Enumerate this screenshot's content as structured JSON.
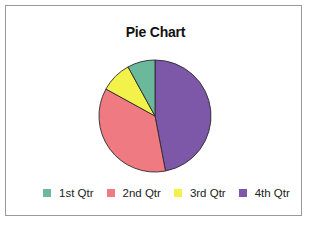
{
  "chart_data": {
    "type": "pie",
    "title": "Pie Chart",
    "categories": [
      "1st Qtr",
      "2nd Qtr",
      "3rd Qtr",
      "4th Qtr"
    ],
    "values": [
      8,
      36,
      9,
      47
    ],
    "unit": "percent (estimated from slice angles)",
    "colors": [
      "#6bb89a",
      "#f07a82",
      "#f2f24a",
      "#7e58a8"
    ],
    "start_angle_deg": 0,
    "direction": "4th Qtr drawn clockwise from 12 o'clock; 1st Qtr counter-clockwise from 12 o'clock",
    "legend_position": "bottom"
  },
  "legend": {
    "items": [
      {
        "label": "1st Qtr",
        "color": "#6bb89a"
      },
      {
        "label": "2nd Qtr",
        "color": "#f07a82"
      },
      {
        "label": "3rd Qtr",
        "color": "#f2f24a"
      },
      {
        "label": "4th Qtr",
        "color": "#7e58a8"
      }
    ]
  }
}
